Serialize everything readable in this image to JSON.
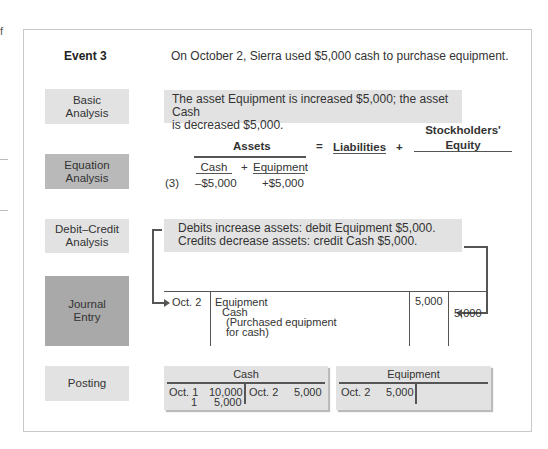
{
  "edge_fragment": "f",
  "event": {
    "title": "Event 3",
    "description": "On October 2, Sierra used $5,000 cash to purchase equipment."
  },
  "rows": {
    "basic": {
      "label_line1": "Basic",
      "label_line2": "Analysis",
      "text_line1": "The asset Equipment is increased $5,000; the asset Cash",
      "text_line2": "is decreased $5,000."
    },
    "equation": {
      "label_line1": "Equation",
      "label_line2": "Analysis",
      "assets_header": "Assets",
      "equals": "=",
      "liabilities_header": "Liabilities",
      "plus": "+",
      "equity_line1": "Stockholders'",
      "equity_line2": "Equity",
      "cash_header": "Cash",
      "asset_plus": "+",
      "equipment_header": "Equipment",
      "row_ref": "(3)",
      "cash_value": "–$5,000",
      "equipment_value": "+$5,000"
    },
    "debit_credit": {
      "label_line1": "Debit–Credit",
      "label_line2": "Analysis",
      "text_line1": "Debits increase assets: debit Equipment $5,000.",
      "text_line2": "Credits decrease assets: credit Cash $5,000."
    },
    "journal": {
      "label_line1": "Journal",
      "label_line2": "Entry",
      "date": "Oct. 2",
      "debit_account": "Equipment",
      "credit_account": "Cash",
      "explanation_line1": "(Purchased equipment",
      "explanation_line2": "for cash)",
      "debit_amount": "5,000",
      "credit_amount": "5,000"
    },
    "posting": {
      "label": "Posting",
      "cash_account": {
        "title": "Cash",
        "debits": [
          {
            "date": "Oct. 1",
            "amount": "10,000"
          },
          {
            "date": "1",
            "amount": "5,000"
          }
        ],
        "credits": [
          {
            "date": "Oct. 2",
            "amount": "5,000"
          }
        ]
      },
      "equipment_account": {
        "title": "Equipment",
        "debits": [
          {
            "date": "Oct. 2",
            "amount": "5,000"
          }
        ],
        "credits": []
      }
    }
  },
  "colors": {
    "light_panel": "#e2e2e2",
    "mid_panel": "#b9b9b9",
    "dark_panel": "#a9a9a9",
    "line": "#555555"
  }
}
